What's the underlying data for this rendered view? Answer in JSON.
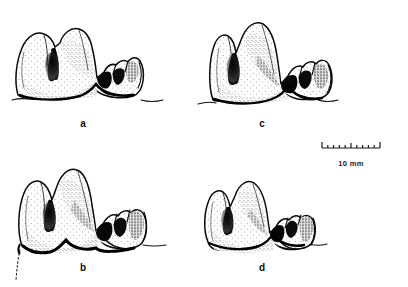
{
  "figure": {
    "type": "scientific-illustration-plate",
    "technique": "stippled pen-and-ink line drawing",
    "background_color": "#ffffff",
    "ink_color": "#0a0a0a",
    "panel_count": 4
  },
  "panels": [
    {
      "id": "a",
      "label": "a",
      "label_x": 83,
      "label_y": 127,
      "position": "top-left",
      "description": "tooth with two tall main cusps and worn posterior cuspule row, basal ground line extending right"
    },
    {
      "id": "b",
      "label": "b",
      "label_x": 83,
      "label_y": 271,
      "position": "bottom-left",
      "description": "tooth with tall sharp anterior cusps, large posterior cingulum, dotted root line at lower left"
    },
    {
      "id": "c",
      "label": "c",
      "label_x": 262,
      "label_y": 127,
      "position": "top-right",
      "description": "tooth with two tall cusps, deep median valley and posterior accessory cusp cluster"
    },
    {
      "id": "d",
      "label": "d",
      "label_x": 262,
      "label_y": 271,
      "position": "bottom-right",
      "description": "smaller tooth with two cusps and posterior cuspule, basal ground line extending right"
    }
  ],
  "scale_bar": {
    "label": "10 mm",
    "label_x": 351,
    "label_y": 166,
    "x_start": 322,
    "x_end": 380,
    "y": 148,
    "minor_tick_count": 9,
    "has_end_caps": true,
    "has_center_tick": true,
    "units": "mm",
    "value": 10
  }
}
